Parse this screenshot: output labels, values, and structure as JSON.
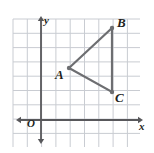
{
  "figure": {
    "type": "coordinate-grid-triangle",
    "background_color": "#ffffff",
    "grid": {
      "line_color": "#c9ccd2",
      "spacing_px": 14.3,
      "left_px": 13,
      "top_px": 19,
      "right_px": 140,
      "bottom_px": 147,
      "columns": 9,
      "rows": 9,
      "visible": true
    },
    "axes": {
      "color": "#58585b",
      "origin_px": {
        "x": 41,
        "y": 120
      },
      "x_axis": {
        "label": "x",
        "arrow_start_px": 16,
        "arrow_end_px": 143,
        "y_px": 120
      },
      "y_axis": {
        "label": "y",
        "arrow_start_px": 16,
        "arrow_end_px": 144,
        "x_px": 41
      },
      "origin_label": "O"
    },
    "shape": {
      "name": "triangle",
      "stroke_color": "#6d6e71",
      "stroke_width_px": 2.2,
      "fill": "none",
      "vertices": [
        {
          "label": "A",
          "grid_x": 2,
          "grid_y": 4,
          "px_x": 69,
          "px_y": 68,
          "label_offset": "left"
        },
        {
          "label": "B",
          "grid_x": 5,
          "grid_y": 7,
          "px_x": 112,
          "px_y": 28,
          "label_offset": "right-above"
        },
        {
          "label": "C",
          "grid_x": 5,
          "grid_y": 2,
          "px_x": 112,
          "px_y": 92,
          "label_offset": "right-below"
        }
      ],
      "edges": [
        {
          "from": "A",
          "to": "B"
        },
        {
          "from": "B",
          "to": "C"
        },
        {
          "from": "C",
          "to": "A"
        }
      ],
      "vertex_dot_radius_px": 2.2,
      "vertex_dot_color": "#6d6e71"
    },
    "label_color": "#231f20"
  }
}
